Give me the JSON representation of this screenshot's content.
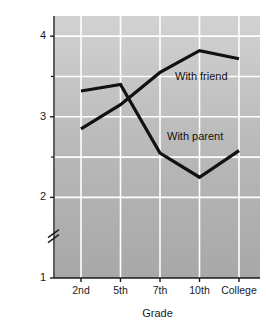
{
  "chart_data": {
    "type": "line",
    "title": "",
    "xlabel": "Grade",
    "ylabel": "Self-disclosure in conversation score",
    "categories": [
      "2nd",
      "5th",
      "7th",
      "10th",
      "College"
    ],
    "ylim": [
      1,
      4.25
    ],
    "yticks": [
      1,
      2,
      3,
      4
    ],
    "yticklabels": [
      "1",
      "2",
      "3",
      "4"
    ],
    "yminorticks": [
      1.5,
      2.5,
      3.5
    ],
    "axis_break": true,
    "axis_break_between": [
      1,
      2
    ],
    "grid": "white gridlines, horizontal at 2, 2.5, 3, 3.5, 4 and vertical at each category",
    "legend_position": "inline annotations on plot",
    "background": "gray vertical gradient, light at top to darker at bottom",
    "series": [
      {
        "name": "With friend",
        "values": [
          2.85,
          3.15,
          3.55,
          3.82,
          3.72
        ],
        "color": "#111111"
      },
      {
        "name": "With parent",
        "values": [
          3.32,
          3.4,
          2.55,
          2.25,
          2.58
        ],
        "color": "#111111"
      }
    ],
    "annotations": [
      {
        "text": "With friend",
        "x": "between 10th and College",
        "y": 3.5
      },
      {
        "text": "With parent",
        "x": "between 10th and College",
        "y": 2.72
      }
    ]
  }
}
